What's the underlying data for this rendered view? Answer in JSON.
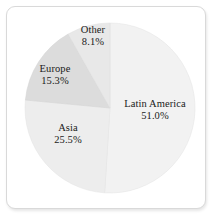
{
  "chart_data": {
    "type": "pie",
    "title": "",
    "subtitle": "",
    "xlabel": "",
    "ylabel": "",
    "legend_position": "none",
    "grid": false,
    "labels_inline": true,
    "start_angle_deg": 0,
    "direction": "clockwise",
    "categories": [
      "Latin America",
      "Asia",
      "Europe",
      "Other"
    ],
    "values": [
      51.0,
      25.5,
      15.3,
      8.1
    ],
    "unit": "%",
    "slices": [
      {
        "name": "Latin America",
        "value": 51.0,
        "value_label": "51.0%",
        "color": "#f2f2f2",
        "start_deg": 0.0,
        "end_deg": 183.6
      },
      {
        "name": "Asia",
        "value": 25.5,
        "value_label": "25.5%",
        "color": "#ededed",
        "start_deg": 183.6,
        "end_deg": 275.4
      },
      {
        "name": "Europe",
        "value": 15.3,
        "value_label": "15.3%",
        "color": "#dcdcdc",
        "start_deg": 275.4,
        "end_deg": 330.5
      },
      {
        "name": "Other",
        "value": 8.1,
        "value_label": "8.1%",
        "color": "#e8e8e8",
        "start_deg": 330.5,
        "end_deg": 360.0
      }
    ]
  },
  "panel": {
    "border_color": "#d9d9d9",
    "background": "#ffffff"
  },
  "labels": {
    "latin_america": {
      "name": "Latin America",
      "value": "51.0%"
    },
    "asia": {
      "name": "Asia",
      "value": "25.5%"
    },
    "europe": {
      "name": "Europe",
      "value": "15.3%"
    },
    "other": {
      "name": "Other",
      "value": "8.1%"
    }
  }
}
